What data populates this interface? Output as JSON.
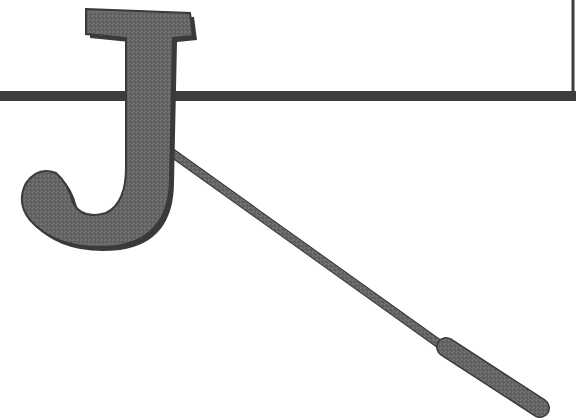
{
  "graphic": {
    "letter": "J",
    "colors": {
      "background": "#ffffff",
      "letter_fill": "#6a6a6a",
      "letter_outline": "#3a3a3a",
      "bar": "#3c3c3c",
      "stick": "#6e6e6e",
      "handle": "#555555"
    }
  }
}
